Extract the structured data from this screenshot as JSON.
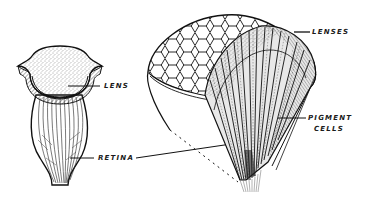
{
  "diagram": {
    "figures": [
      {
        "id": "simple-eye",
        "description": "Simple eye (ocellus) cross-section"
      },
      {
        "id": "compound-eye",
        "description": "Compound eye with cut-away showing ommatidia"
      }
    ],
    "labels": {
      "lens": "LENS",
      "retina": "RETINA",
      "lenses": "LENSES",
      "pigment_line1": "PIGMENT",
      "pigment_line2": "CELLS"
    },
    "colors": {
      "ink": "#1a1a1a",
      "background": "#ffffff"
    }
  }
}
